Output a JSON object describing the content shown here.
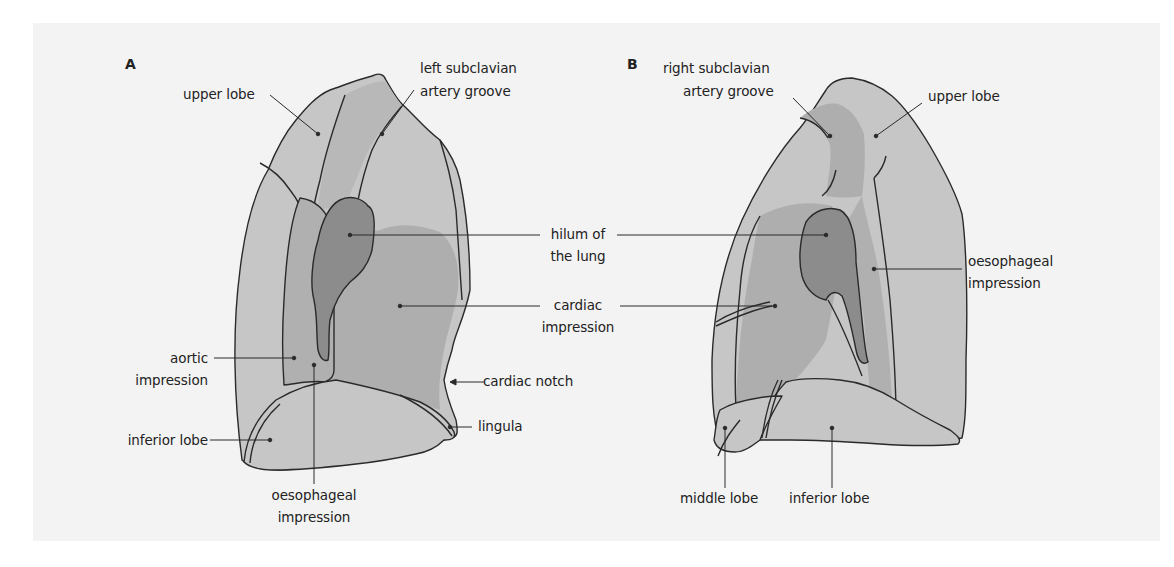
{
  "figure": {
    "panel_a": {
      "letter": "A",
      "labels": {
        "upper_lobe": "upper lobe",
        "left_subclavian_1": "left subclavian",
        "left_subclavian_2": "artery groove",
        "aortic_1": "aortic",
        "aortic_2": "impression",
        "inferior_lobe": "inferior lobe",
        "oesophageal_1": "oesophageal",
        "oesophageal_2": "impression",
        "cardiac_notch": "cardiac notch",
        "lingula": "lingula"
      }
    },
    "shared_labels": {
      "hilum_1": "hilum of",
      "hilum_2": "the lung",
      "cardiac_1": "cardiac",
      "cardiac_2": "impression"
    },
    "panel_b": {
      "letter": "B",
      "labels": {
        "right_subclavian_1": "right subclavian",
        "right_subclavian_2": "artery groove",
        "upper_lobe": "upper lobe",
        "oesophageal_1": "oesophageal",
        "oesophageal_2": "impression",
        "middle_lobe": "middle lobe",
        "inferior_lobe": "inferior lobe"
      }
    },
    "colors": {
      "background_panel": "#f3f3f3",
      "lung_light": "#c6c6c6",
      "lung_mid": "#aeaeae",
      "lung_groove": "#b8b8b8",
      "hilum_dark": "#8c8c8c",
      "outline": "#2a2a2a"
    }
  }
}
